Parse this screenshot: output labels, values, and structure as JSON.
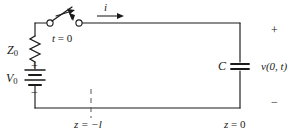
{
  "figure": {
    "type": "circuit-schematic",
    "colors": {
      "wire": "#1a1a1a",
      "text": "#1a1a1a",
      "background": "#ffffff",
      "dashed": "#555555"
    }
  },
  "components": {
    "impedance": {
      "symbol": "Z",
      "subscript": "0",
      "kind": "resistor-zigzag"
    },
    "source": {
      "symbol": "V",
      "subscript": "0",
      "kind": "battery",
      "plus": "+",
      "minus": "−"
    },
    "switch": {
      "label_time": "t",
      "label_equals": "= 0",
      "label_full": "t = 0",
      "kind": "spst-open"
    },
    "capacitor": {
      "symbol": "C",
      "kind": "parallel-plate"
    },
    "current": {
      "symbol": "i",
      "kind": "current-arrow",
      "direction": "right"
    },
    "output_voltage": {
      "symbol": "v(0, t)",
      "plus": "+",
      "minus": "−"
    }
  },
  "axis_labels": {
    "left_position": "z = −l",
    "left_position_symbol": "z",
    "left_position_value": "= −l",
    "right_position": "z = 0",
    "right_position_symbol": "z",
    "right_position_value": "= 0"
  }
}
